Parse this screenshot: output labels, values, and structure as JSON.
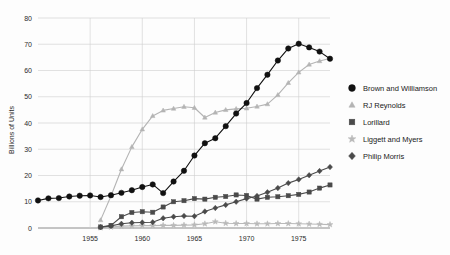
{
  "chart_data": {
    "type": "line",
    "title": "",
    "xlabel": "",
    "ylabel": "Billions of Units",
    "xlim": [
      1950,
      1978
    ],
    "ylim": [
      0,
      80
    ],
    "grid": true,
    "legend_position": "right",
    "y_ticks": [
      0,
      10,
      20,
      30,
      40,
      50,
      60,
      70,
      80
    ],
    "y_tick_labels": [
      "0",
      "10",
      "20",
      "30",
      "40",
      "50",
      "60",
      "70",
      "80"
    ],
    "x_ticks": [
      1955,
      1960,
      1965,
      1970,
      1975
    ],
    "x_tick_labels": [
      "1955",
      "1960",
      "1965",
      "1970",
      "1975"
    ],
    "x": [
      1950,
      1951,
      1952,
      1953,
      1954,
      1955,
      1956,
      1957,
      1958,
      1959,
      1960,
      1961,
      1962,
      1963,
      1964,
      1965,
      1966,
      1967,
      1968,
      1969,
      1970,
      1971,
      1972,
      1973,
      1974,
      1975,
      1976,
      1977,
      1978
    ],
    "series": [
      {
        "name": "Brown and Williamson",
        "marker": "circle",
        "color": "#111111",
        "values": [
          10.5,
          11.3,
          11.4,
          12.0,
          12.3,
          12.4,
          11.8,
          12.5,
          13.4,
          14.4,
          15.6,
          16.6,
          13.3,
          17.7,
          21.8,
          27.6,
          32.3,
          34.2,
          38.8,
          43.6,
          47.6,
          53.3,
          58.4,
          63.8,
          68.4,
          70.2,
          68.8,
          67.2,
          64.5
        ]
      },
      {
        "name": "RJ Reynolds",
        "marker": "triangle",
        "color": "#b4b4b4",
        "values": [
          0,
          0,
          0,
          0,
          0,
          0,
          3.0,
          12.2,
          22.4,
          30.9,
          37.6,
          42.7,
          44.8,
          45.5,
          46.2,
          45.8,
          42.1,
          44.0,
          45.0,
          45.4,
          45.6,
          46.3,
          47.2,
          50.7,
          55.3,
          59.3,
          62.3,
          63.6,
          64.6
        ]
      },
      {
        "name": "Lorillard",
        "marker": "square",
        "color": "#4a4a4a",
        "values": [
          0,
          0,
          0,
          0,
          0,
          0,
          0.4,
          1.0,
          4.3,
          5.9,
          6.2,
          6.0,
          8.0,
          10.0,
          10.4,
          11.2,
          11.0,
          11.7,
          12.0,
          12.6,
          12.4,
          11.0,
          11.7,
          11.9,
          12.3,
          12.8,
          13.7,
          15.2,
          16.4
        ]
      },
      {
        "name": "Liggett and Myers",
        "marker": "star",
        "color": "#b9b9b9",
        "values": [
          0,
          0,
          0,
          0,
          0,
          0,
          0.1,
          0.4,
          0.7,
          0.8,
          0.9,
          0.9,
          1.0,
          1.0,
          1.1,
          1.2,
          1.6,
          2.4,
          1.8,
          1.7,
          1.7,
          1.6,
          1.6,
          1.7,
          1.7,
          1.6,
          1.5,
          1.4,
          1.3
        ]
      },
      {
        "name": "Philip Morris",
        "marker": "diamond",
        "color": "#4a4a4a",
        "values": [
          0,
          0,
          0,
          0,
          0,
          0,
          0.3,
          0.8,
          1.6,
          2.0,
          2.1,
          2.2,
          3.7,
          4.3,
          4.6,
          4.5,
          6.3,
          7.6,
          8.8,
          10.0,
          11.2,
          12.2,
          13.6,
          15.2,
          17.1,
          18.5,
          20.1,
          21.7,
          23.2
        ]
      }
    ]
  },
  "legend": {
    "entries": [
      {
        "label": "Brown and Williamson",
        "marker": "circle",
        "color": "#111111"
      },
      {
        "label": "RJ Reynolds",
        "marker": "triangle",
        "color": "#b4b4b4"
      },
      {
        "label": "Lorillard",
        "marker": "square",
        "color": "#4a4a4a"
      },
      {
        "label": "Liggett and Myers",
        "marker": "star",
        "color": "#b9b9b9"
      },
      {
        "label": "Philip Morris",
        "marker": "diamond",
        "color": "#4a4a4a"
      }
    ]
  }
}
